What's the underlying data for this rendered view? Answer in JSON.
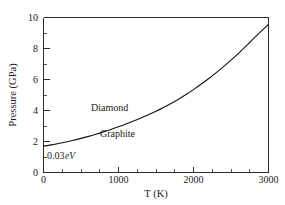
{
  "chart_data": {
    "type": "line",
    "title": "",
    "xlabel": "T (K)",
    "ylabel": "Pressure (GPa)",
    "xlim": [
      0,
      3000
    ],
    "ylim": [
      0,
      10
    ],
    "grid": false,
    "legend": "none",
    "xticks": [
      0,
      1000,
      2000,
      3000
    ],
    "xtick_labels": [
      "0",
      "1000",
      "2000",
      "3000"
    ],
    "xminor_ticks": [
      250,
      500,
      750,
      1250,
      1500,
      1750,
      2250,
      2500,
      2750
    ],
    "yticks": [
      0,
      2,
      4,
      6,
      8,
      10
    ],
    "ytick_labels": [
      "0",
      "2",
      "4",
      "6",
      "8",
      "10"
    ],
    "yminor_ticks": [
      1,
      3,
      5,
      7,
      9
    ],
    "series": [
      {
        "name": "graphite-diamond phase boundary",
        "x": [
          0,
          100,
          200,
          300,
          400,
          500,
          600,
          700,
          800,
          900,
          1000,
          1100,
          1200,
          1300,
          1400,
          1500,
          1600,
          1700,
          1800,
          1900,
          2000,
          2100,
          2200,
          2300,
          2400,
          2500,
          2600,
          2700,
          2800,
          2900,
          3000
        ],
        "y": [
          1.7,
          1.78,
          1.87,
          1.97,
          2.08,
          2.2,
          2.33,
          2.47,
          2.62,
          2.78,
          2.95,
          3.13,
          3.32,
          3.52,
          3.73,
          3.95,
          4.19,
          4.45,
          4.73,
          5.03,
          5.35,
          5.69,
          6.05,
          6.43,
          6.83,
          7.25,
          7.69,
          8.15,
          8.63,
          9.1,
          9.55
        ]
      }
    ],
    "annotations": [
      {
        "id": "diamond",
        "text": "Diamond",
        "x": 600,
        "y": 4.6,
        "style": "normal"
      },
      {
        "id": "graphite",
        "text": "Graphite",
        "x": 1080,
        "y": 2.95,
        "style": "normal"
      },
      {
        "id": "energy-value",
        "text": "0.03",
        "x": 80,
        "y": 1.35,
        "style": "normal"
      },
      {
        "id": "energy-unit",
        "text": "eV",
        "x": 330,
        "y": 1.35,
        "style": "italic"
      }
    ]
  }
}
